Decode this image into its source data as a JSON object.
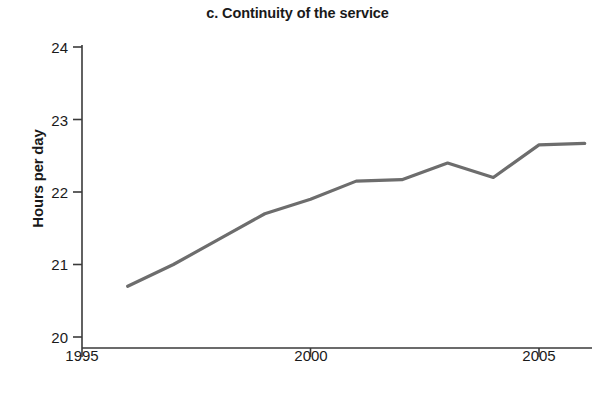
{
  "chart_data": {
    "type": "line",
    "title": "c. Continuity of the service",
    "xlabel": "Year",
    "ylabel": "Hours per day",
    "x": [
      1996,
      1997,
      1998,
      1999,
      2000,
      2001,
      2002,
      2003,
      2004,
      2005,
      2006
    ],
    "values": [
      20.7,
      21.0,
      21.35,
      21.7,
      21.9,
      22.15,
      22.17,
      22.4,
      22.2,
      22.65,
      22.67
    ],
    "series": [
      {
        "name": "Continuity of the service",
        "values": [
          20.7,
          21.0,
          21.35,
          21.7,
          21.9,
          22.15,
          22.17,
          22.4,
          22.2,
          22.65,
          22.67
        ]
      }
    ],
    "xlim": [
      1995,
      2006.1
    ],
    "ylim": [
      20,
      24
    ],
    "yticks": [
      20,
      21,
      22,
      23,
      24
    ],
    "ytick_labels": [
      "20",
      "21",
      "22",
      "23",
      "24"
    ],
    "xticks": [
      1995,
      2000,
      2005
    ],
    "xtick_labels": [
      "1995",
      "2000",
      "2005"
    ],
    "grid": false,
    "legend": null,
    "line_color": "#6d6d6d",
    "axis_color": "#3a3a3a",
    "line_width": 3
  }
}
